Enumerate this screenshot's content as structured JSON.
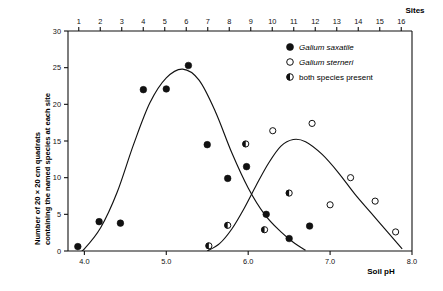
{
  "chart_data": {
    "type": "scatter",
    "title": "",
    "xlabel": "Soil pH",
    "ylabel": "Number of 20 × 20 cm quadrats containing the named species at each site",
    "ylabel_line1": "Number of 20 × 20 cm quadrats",
    "ylabel_line2": "containing the named species at each site",
    "top_axis_label": "Sites",
    "xlim": [
      3.8,
      8.0
    ],
    "ylim": [
      0,
      30
    ],
    "xticks": [
      "4.0",
      "5.0",
      "6.0",
      "7.0",
      "8.0"
    ],
    "xtick_values": [
      4.0,
      5.0,
      6.0,
      7.0,
      8.0
    ],
    "yticks": [
      "0",
      "5",
      "10",
      "15",
      "20",
      "25",
      "30"
    ],
    "ytick_values": [
      0,
      5,
      10,
      15,
      20,
      25,
      30
    ],
    "top_ticks": [
      "1",
      "2",
      "3",
      "4",
      "5",
      "6",
      "7",
      "8",
      "9",
      "10",
      "11",
      "12",
      "13",
      "14",
      "15",
      "16"
    ],
    "top_tick_values": [
      1,
      2,
      3,
      4,
      5,
      6,
      7,
      8,
      9,
      10,
      11,
      12,
      13,
      14,
      15,
      16
    ],
    "grid": false,
    "legend_position": "upper right",
    "colors": {
      "ink": "#111111",
      "background": "#ffffff",
      "marker_fill": "#111111",
      "marker_open": "#ffffff"
    },
    "legend": [
      {
        "label": "Galium saxatile",
        "marker": "filled-circle",
        "italic": true
      },
      {
        "label": "Galium sterneri",
        "marker": "open-circle",
        "italic": true
      },
      {
        "label": "both  species  present",
        "marker": "half-filled-circle",
        "italic": false
      }
    ],
    "series": [
      {
        "name": "Galium saxatile",
        "marker": "filled-circle",
        "points": [
          {
            "x": 3.92,
            "y": 0.6
          },
          {
            "x": 4.18,
            "y": 4.0
          },
          {
            "x": 4.44,
            "y": 3.8
          },
          {
            "x": 4.72,
            "y": 22.0
          },
          {
            "x": 5.0,
            "y": 22.1
          },
          {
            "x": 5.27,
            "y": 25.3
          },
          {
            "x": 5.5,
            "y": 14.5
          },
          {
            "x": 5.75,
            "y": 9.9
          },
          {
            "x": 5.98,
            "y": 11.5
          },
          {
            "x": 6.22,
            "y": 5.0
          },
          {
            "x": 6.5,
            "y": 1.7
          },
          {
            "x": 6.75,
            "y": 3.4
          }
        ]
      },
      {
        "name": "Galium sterneri",
        "marker": "open-circle",
        "points": [
          {
            "x": 6.3,
            "y": 16.4
          },
          {
            "x": 6.78,
            "y": 17.4
          },
          {
            "x": 7.0,
            "y": 6.3
          },
          {
            "x": 7.25,
            "y": 10.0
          },
          {
            "x": 7.55,
            "y": 6.8
          },
          {
            "x": 7.8,
            "y": 2.6
          }
        ]
      },
      {
        "name": "both species present",
        "marker": "half-filled-circle",
        "points": [
          {
            "x": 5.52,
            "y": 0.7
          },
          {
            "x": 5.75,
            "y": 3.5
          },
          {
            "x": 5.97,
            "y": 14.6
          },
          {
            "x": 6.2,
            "y": 2.9
          },
          {
            "x": 6.5,
            "y": 7.9
          }
        ]
      }
    ],
    "fitted_curves": [
      {
        "name": "Galium saxatile fitted curve",
        "points": [
          {
            "x": 3.85,
            "y": -1.0
          },
          {
            "x": 4.0,
            "y": 0.3
          },
          {
            "x": 4.2,
            "y": 3.2
          },
          {
            "x": 4.4,
            "y": 8.0
          },
          {
            "x": 4.6,
            "y": 14.5
          },
          {
            "x": 4.8,
            "y": 20.2
          },
          {
            "x": 5.0,
            "y": 23.6
          },
          {
            "x": 5.2,
            "y": 24.8
          },
          {
            "x": 5.4,
            "y": 23.3
          },
          {
            "x": 5.6,
            "y": 19.0
          },
          {
            "x": 5.8,
            "y": 13.4
          },
          {
            "x": 6.0,
            "y": 8.6
          },
          {
            "x": 6.2,
            "y": 5.0
          },
          {
            "x": 6.4,
            "y": 2.6
          },
          {
            "x": 6.55,
            "y": 1.2
          },
          {
            "x": 6.7,
            "y": 0.1
          }
        ]
      },
      {
        "name": "Galium sterneri fitted curve",
        "points": [
          {
            "x": 5.5,
            "y": 0.0
          },
          {
            "x": 5.65,
            "y": 1.0
          },
          {
            "x": 5.8,
            "y": 3.0
          },
          {
            "x": 5.95,
            "y": 5.8
          },
          {
            "x": 6.1,
            "y": 9.0
          },
          {
            "x": 6.25,
            "y": 12.0
          },
          {
            "x": 6.4,
            "y": 14.3
          },
          {
            "x": 6.55,
            "y": 15.2
          },
          {
            "x": 6.7,
            "y": 14.9
          },
          {
            "x": 6.9,
            "y": 13.2
          },
          {
            "x": 7.1,
            "y": 10.7
          },
          {
            "x": 7.3,
            "y": 7.8
          },
          {
            "x": 7.5,
            "y": 5.2
          },
          {
            "x": 7.7,
            "y": 2.6
          },
          {
            "x": 7.88,
            "y": 0.3
          }
        ]
      }
    ]
  }
}
